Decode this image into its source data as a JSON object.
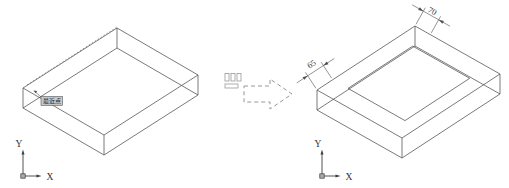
{
  "figure": {
    "left_view": {
      "snap_tooltip": "最近点",
      "ucs": {
        "x": "X",
        "y": "Y"
      }
    },
    "transition": {
      "icon": "command-button-icon",
      "style": "dashed-block-arrow-right"
    },
    "right_view": {
      "dims": {
        "top": "70",
        "left": "65"
      },
      "ucs": {
        "x": "X",
        "y": "Y"
      }
    },
    "colors": {
      "line": "#4e4e4e",
      "dashed_arrow": "#989898",
      "tooltip_bg": "#c8c8c8"
    }
  }
}
